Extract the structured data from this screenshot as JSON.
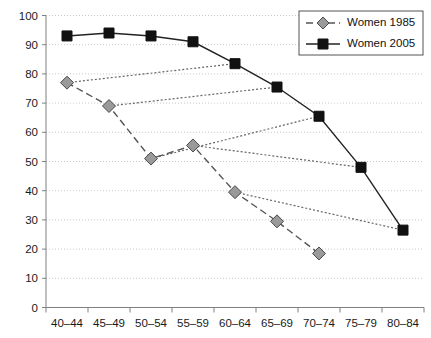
{
  "chart_data": {
    "type": "line",
    "title": "",
    "subtitle": "",
    "xlabel": "",
    "ylabel": "",
    "ylim": [
      0,
      100
    ],
    "ytick_step": 10,
    "yticks": [
      "0",
      "10",
      "20",
      "30",
      "40",
      "50",
      "60",
      "70",
      "80",
      "90",
      "100"
    ],
    "categories": [
      "40–44",
      "45–49",
      "50–54",
      "55–59",
      "60–64",
      "65–69",
      "70–74",
      "75–79",
      "80–84"
    ],
    "grid": "horizontal-dotted",
    "legend_position": "top-right",
    "series": [
      {
        "name": "Women 1985",
        "marker": "diamond",
        "line_style": "dashed",
        "color": "#9a9a9a",
        "values": [
          77,
          69,
          51,
          55.5,
          39.5,
          29.5,
          18.5,
          null,
          null
        ]
      },
      {
        "name": "Women 2005",
        "marker": "square",
        "line_style": "solid",
        "color": "#111111",
        "values": [
          93,
          94,
          93,
          91,
          83.5,
          75.5,
          65.5,
          48,
          26.5
        ]
      }
    ],
    "cohort_connectors": [
      {
        "from_category": "40–44",
        "from_value": 77,
        "to_category": "60–64",
        "to_value": 83.5
      },
      {
        "from_category": "45–49",
        "from_value": 69,
        "to_category": "65–69",
        "to_value": 75.5
      },
      {
        "from_category": "50–54",
        "from_value": 51,
        "to_category": "70–74",
        "to_value": 65.5
      },
      {
        "from_category": "55–59",
        "from_value": 55.5,
        "to_category": "75–79",
        "to_value": 48
      },
      {
        "from_category": "60–64",
        "from_value": 39.5,
        "to_category": "80–84",
        "to_value": 26.5
      }
    ]
  },
  "legend": {
    "entries": [
      {
        "label": "Women 1985"
      },
      {
        "label": "Women 2005"
      }
    ]
  },
  "colors": {
    "series_1985": "#9a9a9a",
    "series_2005": "#111111",
    "grid": "#c8c8c8",
    "axis": "#808080",
    "background": "#ffffff"
  }
}
